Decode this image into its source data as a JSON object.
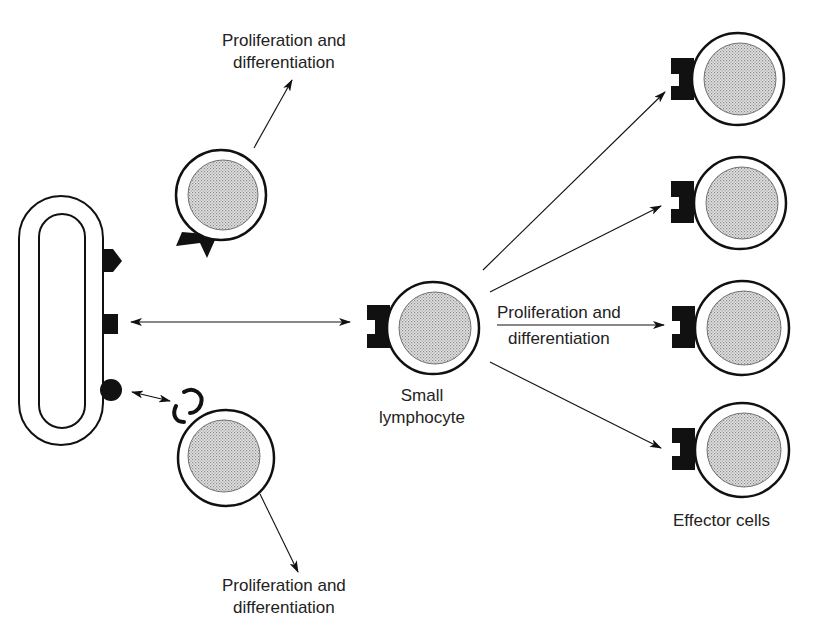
{
  "diagram": {
    "type": "biology-schematic",
    "colors": {
      "ink": "#111111",
      "nucleus_fill": "#d6d6d6",
      "nucleus_dot": "#8a8a8a",
      "background": "#ffffff"
    },
    "labels": {
      "top": {
        "line1": "Proliferation and",
        "line2": "differentiation"
      },
      "bottom": {
        "line1": "Proliferation and",
        "line2": "differentiation"
      },
      "middle": {
        "line1": "Proliferation and",
        "line2": "differentiation"
      },
      "small_lymphocyte": {
        "line1": "Small",
        "line2": "lymphocyte"
      },
      "effector_cells": "Effector cells"
    },
    "nodes": [
      {
        "id": "pathogen",
        "shape": "rounded-oval",
        "antigens": [
          "pentagon",
          "square",
          "circle"
        ]
      },
      {
        "id": "lymphocyte-top",
        "receptor": "wedge",
        "matches": "none"
      },
      {
        "id": "lymphocyte-bottom",
        "receptor": "hook",
        "matches": "circle"
      },
      {
        "id": "small-lymphocyte",
        "receptor": "notched-square",
        "matches": "square"
      },
      {
        "id": "effector-1",
        "receptor": "notched-square"
      },
      {
        "id": "effector-2",
        "receptor": "notched-square"
      },
      {
        "id": "effector-3",
        "receptor": "notched-square"
      },
      {
        "id": "effector-4",
        "receptor": "notched-square"
      }
    ],
    "edges": [
      {
        "from": "pathogen",
        "to": "small-lymphocyte",
        "style": "double-arrow"
      },
      {
        "from": "pathogen",
        "to": "lymphocyte-bottom",
        "style": "double-arrow"
      },
      {
        "from": "lymphocyte-top",
        "to": "label-top",
        "style": "arrow"
      },
      {
        "from": "lymphocyte-bottom",
        "to": "label-bottom",
        "style": "arrow"
      },
      {
        "from": "small-lymphocyte",
        "to": "effector-1",
        "style": "arrow"
      },
      {
        "from": "small-lymphocyte",
        "to": "effector-2",
        "style": "arrow"
      },
      {
        "from": "small-lymphocyte",
        "to": "effector-3",
        "style": "arrow",
        "label": "Proliferation and differentiation"
      },
      {
        "from": "small-lymphocyte",
        "to": "effector-4",
        "style": "arrow"
      }
    ]
  }
}
